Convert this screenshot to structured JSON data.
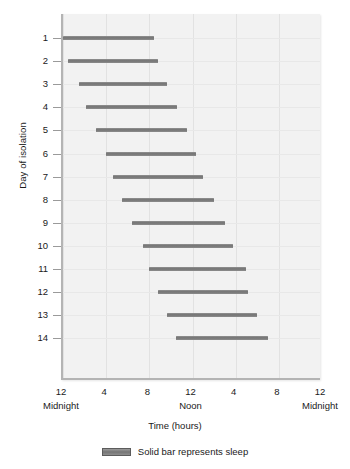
{
  "chart_data": {
    "type": "bar",
    "title": "",
    "subtitle": "",
    "xlabel": "Time (hours)",
    "ylabel": "Day of isolation",
    "xlim": [
      0,
      24
    ],
    "ylim": [
      1,
      14
    ],
    "grid": true,
    "orientation": "horizontal",
    "bar_style": "range/gantt",
    "legend": {
      "position": "bottom-center",
      "entries": [
        {
          "label": "Solid bar represents sleep",
          "color": "#7a7a7a",
          "icon": "solid-bar-swatch"
        }
      ]
    },
    "x_ticks": [
      {
        "value": 0,
        "label": "12",
        "sublabel": "Midnight"
      },
      {
        "value": 4,
        "label": "4",
        "sublabel": ""
      },
      {
        "value": 8,
        "label": "8",
        "sublabel": ""
      },
      {
        "value": 12,
        "label": "12",
        "sublabel": "Noon"
      },
      {
        "value": 16,
        "label": "4",
        "sublabel": ""
      },
      {
        "value": 20,
        "label": "8",
        "sublabel": ""
      },
      {
        "value": 24,
        "label": "12",
        "sublabel": "Midnight"
      }
    ],
    "categories": [
      "1",
      "2",
      "3",
      "4",
      "5",
      "6",
      "7",
      "8",
      "9",
      "10",
      "11",
      "12",
      "13",
      "14"
    ],
    "series": [
      {
        "name": "Sleep episode",
        "color": "#7a7a7a",
        "bars": [
          {
            "day": 1,
            "start": 0.0,
            "end": 8.4,
            "duration": 8.4
          },
          {
            "day": 2,
            "start": 0.5,
            "end": 8.8,
            "duration": 8.3
          },
          {
            "day": 3,
            "start": 1.5,
            "end": 9.6,
            "duration": 8.1
          },
          {
            "day": 4,
            "start": 2.1,
            "end": 10.6,
            "duration": 8.5
          },
          {
            "day": 5,
            "start": 3.1,
            "end": 11.5,
            "duration": 8.4
          },
          {
            "day": 6,
            "start": 4.0,
            "end": 12.3,
            "duration": 8.3
          },
          {
            "day": 7,
            "start": 4.6,
            "end": 13.0,
            "duration": 8.4
          },
          {
            "day": 8,
            "start": 5.5,
            "end": 14.0,
            "duration": 8.5
          },
          {
            "day": 9,
            "start": 6.4,
            "end": 15.0,
            "duration": 8.6
          },
          {
            "day": 10,
            "start": 7.4,
            "end": 15.8,
            "duration": 8.4
          },
          {
            "day": 11,
            "start": 8.0,
            "end": 17.0,
            "duration": 9.0
          },
          {
            "day": 12,
            "start": 8.8,
            "end": 17.1,
            "duration": 8.3
          },
          {
            "day": 13,
            "start": 9.6,
            "end": 18.0,
            "duration": 8.4
          },
          {
            "day": 14,
            "start": 10.5,
            "end": 19.0,
            "duration": 8.5
          }
        ]
      }
    ]
  },
  "axes": {
    "y_title": "Day of isolation",
    "x_title": "Time (hours)"
  }
}
